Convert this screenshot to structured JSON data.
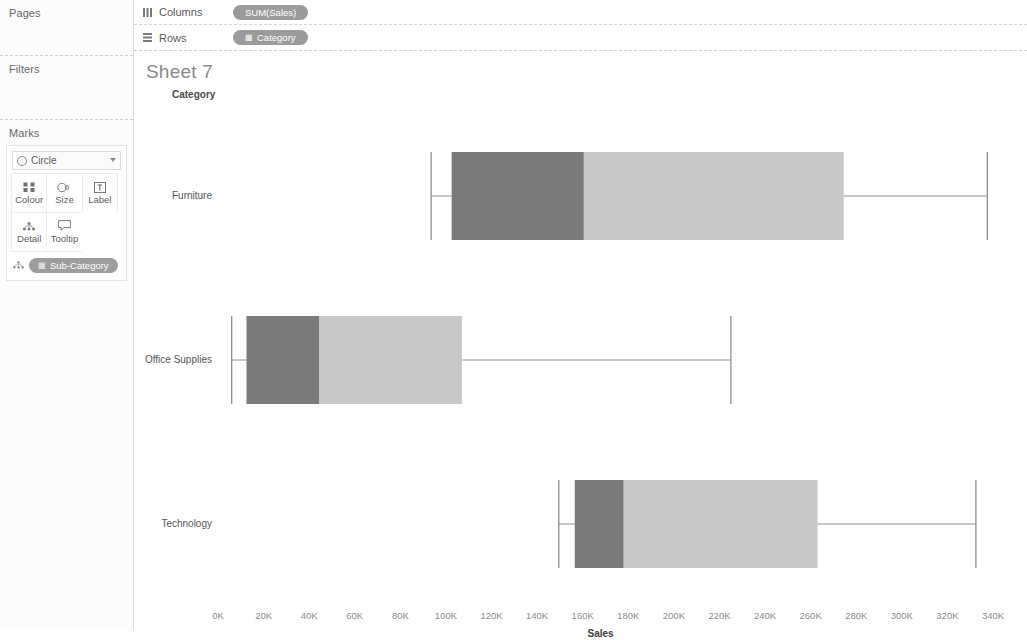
{
  "sidebar": {
    "pages": {
      "title": "Pages"
    },
    "filters": {
      "title": "Filters"
    },
    "marks": {
      "title": "Marks",
      "mark_type": "Circle",
      "mark_type_icon": "circle-icon",
      "buttons": [
        {
          "label": "Colour",
          "icon": "colour-icon"
        },
        {
          "label": "Size",
          "icon": "size-icon"
        },
        {
          "label": "Label",
          "icon": "label-icon"
        },
        {
          "label": "Detail",
          "icon": "detail-icon"
        },
        {
          "label": "Tooltip",
          "icon": "tooltip-icon"
        }
      ],
      "detail_pill": {
        "icon": "detail-icon",
        "dot": "▦",
        "label": "Sub-Category"
      }
    }
  },
  "shelves": {
    "columns": {
      "label": "Columns",
      "icon": "columns-icon",
      "pill": "SUM(Sales)",
      "pill_dot": ""
    },
    "rows": {
      "label": "Rows",
      "icon": "rows-icon",
      "pill": "Category",
      "pill_dot": "▦"
    }
  },
  "sheet": {
    "title": "Sheet 7",
    "field_caption": "Category"
  },
  "colors": {
    "box_dark": "#7b7b7b",
    "box_light": "#c8c8c8",
    "whisker": "#8e8e8e",
    "pill": "#9b9b9b",
    "text": "#555555",
    "tick_text": "#8c8c8c",
    "title_text": "#8a8a8a"
  },
  "chart_data": {
    "type": "bar",
    "chart_subtype": "box-plot",
    "title": "Sheet 7",
    "xlabel": "Sales",
    "ylabel": "Category",
    "xlim": [
      0,
      345000
    ],
    "grid": false,
    "legend": false,
    "xticks": [
      0,
      20000,
      40000,
      60000,
      80000,
      100000,
      120000,
      140000,
      160000,
      180000,
      200000,
      220000,
      240000,
      260000,
      280000,
      300000,
      320000,
      340000
    ],
    "xticklabels": [
      "0K",
      "20K",
      "40K",
      "60K",
      "80K",
      "100K",
      "120K",
      "140K",
      "160K",
      "180K",
      "200K",
      "220K",
      "240K",
      "260K",
      "280K",
      "300K",
      "320K",
      "340K"
    ],
    "categories": [
      "Furniture",
      "Office Supplies",
      "Technology"
    ],
    "boxes": [
      {
        "category": "Furniture",
        "lower_whisker": 93500,
        "q1": 102500,
        "median": 160500,
        "q3": 274500,
        "upper_whisker": 337500
      },
      {
        "category": "Office Supplies",
        "lower_whisker": 6000,
        "q1": 12500,
        "median": 44500,
        "q3": 107000,
        "upper_whisker": 225000
      },
      {
        "category": "Technology",
        "lower_whisker": 149500,
        "q1": 156500,
        "median": 178000,
        "q3": 263000,
        "upper_whisker": 332500
      }
    ]
  }
}
